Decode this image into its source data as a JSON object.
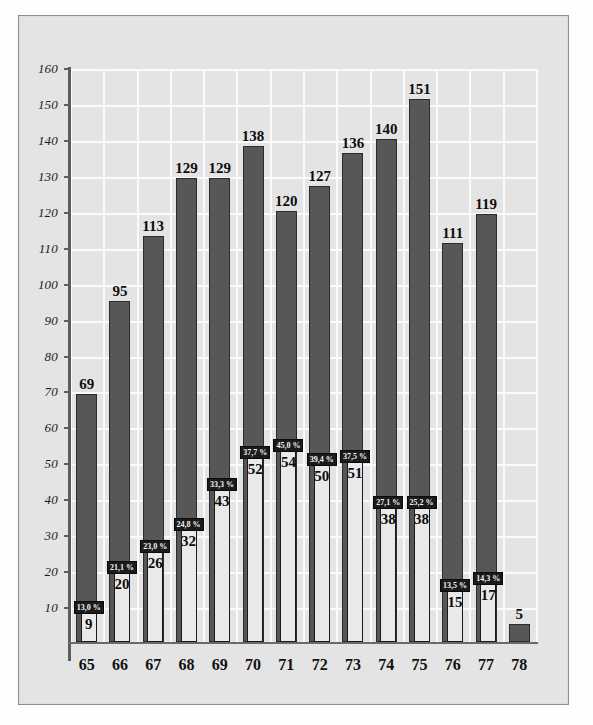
{
  "chart_data": {
    "type": "bar",
    "title": "",
    "subtitle": "",
    "xlabel": "",
    "ylabel": "",
    "categories": [
      "65",
      "66",
      "67",
      "68",
      "69",
      "70",
      "71",
      "72",
      "73",
      "74",
      "75",
      "76",
      "77",
      "78"
    ],
    "series": [
      {
        "name": "total",
        "values": [
          69,
          95,
          113,
          129,
          129,
          138,
          120,
          127,
          136,
          140,
          151,
          111,
          119,
          5
        ]
      },
      {
        "name": "subset",
        "values": [
          9,
          20,
          26,
          32,
          43,
          52,
          54,
          50,
          51,
          38,
          38,
          15,
          17,
          null
        ]
      }
    ],
    "percent_labels": [
      "13,0 %",
      "21,1 %",
      "23,0 %",
      "24,8 %",
      "33,3 %",
      "37,7 %",
      "45,0 %",
      "39,4 %",
      "37,5 %",
      "27,1 %",
      "25,2 %",
      "13,5 %",
      "14,3 %",
      ""
    ],
    "yticks": [
      10,
      20,
      30,
      40,
      50,
      60,
      70,
      80,
      90,
      100,
      110,
      120,
      130,
      140,
      150,
      160
    ],
    "ylim": [
      0,
      160
    ],
    "grid": true,
    "legend": "none",
    "colors": {
      "total_bar": "#575757",
      "subset_bar": "#e9e9e9",
      "panel_background": "#e4e4e4",
      "gridline": "#fafafa",
      "axis": "#5d5d5d",
      "pct_badge_background": "#1b1b1b",
      "pct_badge_text": "#f4f4f4"
    }
  }
}
